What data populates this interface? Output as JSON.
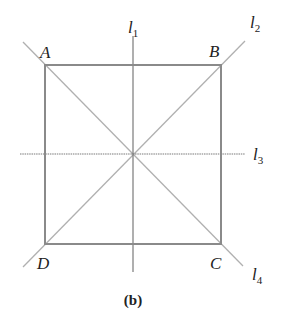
{
  "figure": {
    "caption": "(b)",
    "square": {
      "vertices": [
        {
          "name": "A",
          "x": 45,
          "y": 65
        },
        {
          "name": "B",
          "x": 221,
          "y": 65
        },
        {
          "name": "C",
          "x": 221,
          "y": 244
        },
        {
          "name": "D",
          "x": 45,
          "y": 244
        }
      ],
      "stroke": "#8a8a8a"
    },
    "center": {
      "x": 133,
      "y": 154
    },
    "lines": [
      {
        "id": "l1",
        "base": "l",
        "sub": "1",
        "kind": "vertical axis"
      },
      {
        "id": "l2",
        "base": "l",
        "sub": "2",
        "kind": "diagonal D-B"
      },
      {
        "id": "l3",
        "base": "l",
        "sub": "3",
        "kind": "horizontal axis"
      },
      {
        "id": "l4",
        "base": "l",
        "sub": "4",
        "kind": "diagonal A-C"
      }
    ],
    "colors": {
      "square_edge": "#8a8a8a",
      "axis_line": "#7a7a7a",
      "diagonal_line": "#b0b0b0",
      "text": "#222222"
    }
  }
}
